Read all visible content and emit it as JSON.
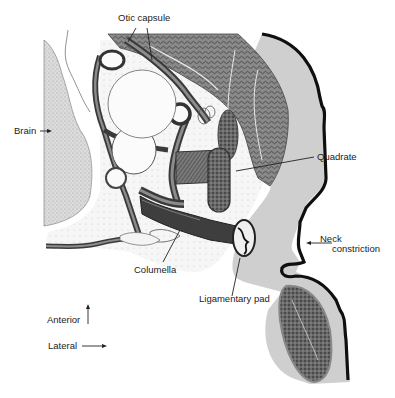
{
  "figure": {
    "colors": {
      "ink": "#1e1e1e",
      "skin_dark": "#0f0f0f",
      "dermis": "#c9c9c9",
      "brain": "#d6d6d6",
      "muscle": "#6f6f6f",
      "cartilage": "#555555",
      "tissue_light": "#eeeeee",
      "background": "#ffffff"
    }
  },
  "labels": {
    "otic_capsule": "Otic capsule",
    "brain": "Brain",
    "quadrate": "Quadrate",
    "neck_line1": "Neck",
    "neck_line2": "constriction",
    "columella": "Columella",
    "ligamentary_pad": "Ligamentary pad",
    "anterior": "Anterior",
    "lateral": "Lateral"
  },
  "orientation": {
    "anterior_arrow": "up",
    "lateral_arrow": "right"
  }
}
